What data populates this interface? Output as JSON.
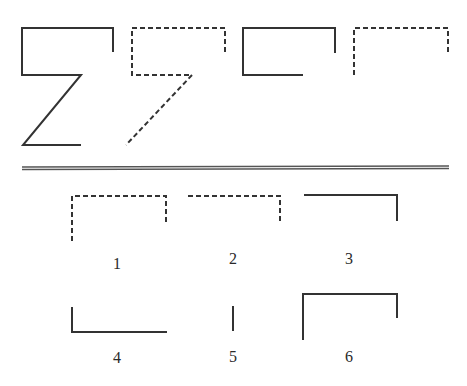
{
  "question": {
    "description": "Figure sequence puzzle: top row shows a progression of figures; bottom shows six answer options numbered 1-6.",
    "sequence": [
      {
        "id": "seq-1",
        "style": "solid",
        "shape": "Z-like figure: open rectangle top with diagonal stroke"
      },
      {
        "id": "seq-2",
        "style": "dashed",
        "shape": "7-like figure: open rectangle top with diagonal stroke"
      },
      {
        "id": "seq-3",
        "style": "solid",
        "shape": "open rectangle (C-like) with short right side"
      },
      {
        "id": "seq-4",
        "style": "dashed",
        "shape": "inverted U with long left side"
      }
    ]
  },
  "options": [
    {
      "number": "1",
      "style": "dashed",
      "shape": "inverted U, longer left side"
    },
    {
      "number": "2",
      "style": "dashed",
      "shape": "top line with right side down"
    },
    {
      "number": "3",
      "style": "solid",
      "shape": "top line with right side down"
    },
    {
      "number": "4",
      "style": "solid",
      "shape": "L shape: left side up with bottom line"
    },
    {
      "number": "5",
      "style": "solid",
      "shape": "single vertical line"
    },
    {
      "number": "6",
      "style": "solid",
      "shape": "inverted U, longer left side"
    }
  ],
  "colors": {
    "stroke": "#333333",
    "background": "#ffffff"
  }
}
